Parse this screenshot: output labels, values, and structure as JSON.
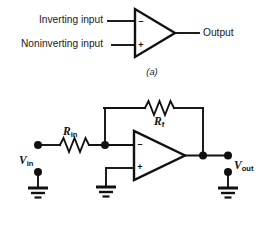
{
  "figure": {
    "background_color": "#ffffff",
    "line_color": "#111111"
  },
  "panel_a": {
    "caption": "(a)",
    "inverting_input_label": "Inverting input",
    "noninverting_input_label": "Noninverting input",
    "output_label": "Output",
    "inverting_sign": "–",
    "noninverting_sign": "+"
  },
  "panel_b": {
    "caption": "",
    "input_source_label": "V",
    "input_source_subscript": "in",
    "output_label": "V",
    "output_subscript": "out",
    "input_resistor_label": "R",
    "input_resistor_subscript": "in",
    "feedback_resistor_label": "R",
    "feedback_resistor_subscript": "f",
    "inverting_sign": "–",
    "noninverting_sign": "+",
    "ground_count": 3,
    "ground_names": [
      "input-ground",
      "noninverting-ground",
      "output-ground"
    ]
  },
  "icons": {
    "amplifier": "triangle-amplifier-icon",
    "resistor": "zigzag-resistor-icon",
    "ground": "earth-ground-icon",
    "junction": "junction-dot-icon"
  }
}
